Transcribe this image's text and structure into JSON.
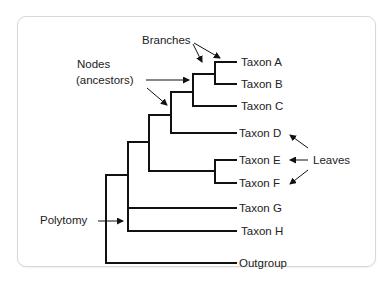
{
  "caption_cropped": "",
  "diagram": {
    "type": "phylogenetic-tree",
    "leaves": [
      {
        "id": "A",
        "label": "Taxon A"
      },
      {
        "id": "B",
        "label": "Taxon B"
      },
      {
        "id": "C",
        "label": "Taxon C"
      },
      {
        "id": "D",
        "label": "Taxon D"
      },
      {
        "id": "E",
        "label": "Taxon E"
      },
      {
        "id": "F",
        "label": "Taxon F"
      },
      {
        "id": "G",
        "label": "Taxon G"
      },
      {
        "id": "H",
        "label": "Taxon H"
      },
      {
        "id": "OUT",
        "label": "Outgroup"
      }
    ],
    "annotations": {
      "branches": "Branches",
      "nodes_line1": "Nodes",
      "nodes_line2": "(ancestors)",
      "leaves": "Leaves",
      "polytomy": "Polytomy"
    },
    "topology": "((((((A,B),C),D),(E,F)),G,H),Outgroup)",
    "line_color": "#111111",
    "text_color": "#222222",
    "card_border_color": "#d8d8d8"
  }
}
